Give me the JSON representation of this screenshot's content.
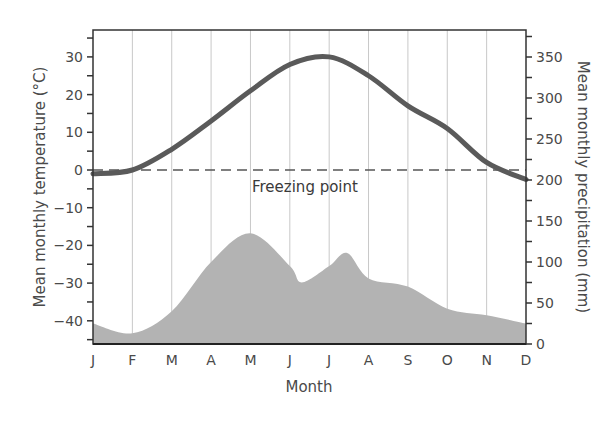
{
  "chart_data": {
    "type": "line+area",
    "title": "",
    "xlabel": "Month",
    "ylabel": "Mean monthly temperature (°C)",
    "ylabel_right": "Mean monthly precipitation (mm)",
    "categories": [
      "J",
      "F",
      "M",
      "A",
      "M",
      "J",
      "J",
      "A",
      "S",
      "O",
      "N",
      "D"
    ],
    "series": [
      {
        "name": "Mean monthly temperature",
        "axis": "left",
        "type": "line",
        "color": "#5a5a5a",
        "values": [
          -1,
          0,
          5.5,
          13,
          21,
          28,
          30,
          25,
          17,
          11,
          2,
          -2.5
        ]
      },
      {
        "name": "Mean monthly precipitation",
        "axis": "right",
        "type": "area",
        "color": "#b3b3b3",
        "values": [
          25,
          13,
          40,
          100,
          135,
          95,
          95,
          80,
          70,
          43,
          35,
          25
        ]
      }
    ],
    "ylim_left": [
      -46,
      37
    ],
    "yticks_left": [
      30,
      20,
      10,
      0,
      -10,
      -20,
      -30,
      -40
    ],
    "ylim_right": [
      0,
      383
    ],
    "yticks_right": [
      350,
      300,
      250,
      200,
      150,
      100,
      50,
      0
    ],
    "reference_line": {
      "axis": "left",
      "value": 0,
      "style": "dashed",
      "label": "Freezing point"
    },
    "grid": {
      "vertical": true,
      "horizontal": false
    }
  },
  "labels": {
    "x_title": "Month",
    "y_left_title": "Mean monthly temperature (°C)",
    "y_right_title": "Mean monthly precipitation (mm)",
    "freezing": "Freezing point",
    "months": [
      "J",
      "F",
      "M",
      "A",
      "M",
      "J",
      "J",
      "A",
      "S",
      "O",
      "N",
      "D"
    ],
    "left_ticks": [
      "30",
      "20",
      "10",
      "0",
      "-10",
      "-20",
      "-30",
      "-40"
    ],
    "right_ticks": [
      "350",
      "300",
      "250",
      "200",
      "150",
      "100",
      "50",
      "0"
    ]
  }
}
